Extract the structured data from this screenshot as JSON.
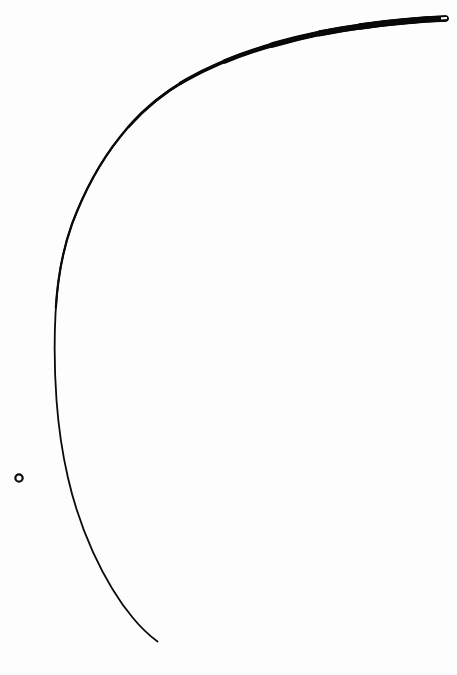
{
  "page": {
    "title": "Hand-drawn arc with center mark",
    "width": 675,
    "canvas_width": 457,
    "canvas_height": 675,
    "background_color": "#fdfdfd",
    "ink_color": "#0a0a0a"
  },
  "marks": {
    "arc": {
      "name": "main-arc",
      "ink_color": "#0a0a0a",
      "stroke_min_width": 1.8,
      "stroke_max_width": 6.4,
      "start_point": "445,18",
      "end_point": "158,641",
      "leftmost_x": 56,
      "leftmost_y": 385,
      "spine_path": "M 445.5 18.5 C 420 19.5 392 22 364 26 C 330 30.5 300 37 274 44.5 C 240 54 210 66.5 186 80 C 160 95 138 114 120 137 C 100 162 84 192 72 224 C 62 252 57 282 55.5 314 C 54 344 54.5 372 56.5 400 C 58.5 428 62 452 68 478 C 74 504 82 528 93 552 C 104 576 118 600 133 618 C 142 629 150 636 157.5 641.5",
      "taper_stops": [
        {
          "t": 0.0,
          "width": 6.4
        },
        {
          "t": 0.06,
          "width": 6.2
        },
        {
          "t": 0.13,
          "width": 5.6
        },
        {
          "t": 0.22,
          "width": 4.6
        },
        {
          "t": 0.32,
          "width": 3.4
        },
        {
          "t": 0.42,
          "width": 2.6
        },
        {
          "t": 0.55,
          "width": 2.2
        },
        {
          "t": 0.72,
          "width": 2.0
        },
        {
          "t": 0.88,
          "width": 1.9
        },
        {
          "t": 1.0,
          "width": 1.6
        }
      ],
      "tip_notch": {
        "name": "arc-tip-notch",
        "x": 441,
        "y": 18,
        "width": 6,
        "height": 2.2
      }
    },
    "center_ring": {
      "name": "center-point-ring",
      "center_x": 19,
      "center_y": 478,
      "outer_radius": 5.0,
      "inner_radius": 2.3,
      "stroke_width": 2.2,
      "ink_color": "#0a0a0a"
    }
  }
}
